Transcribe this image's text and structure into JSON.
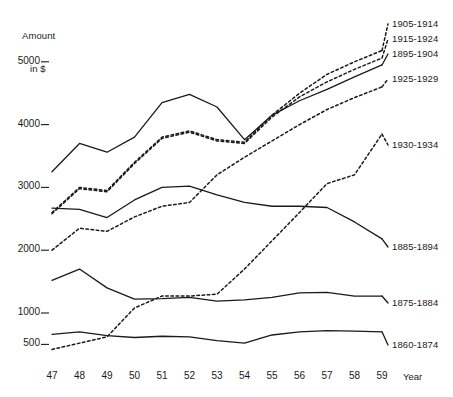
{
  "chart_data": {
    "type": "line",
    "title": "",
    "subtitle": "",
    "ylabel": "Amount\nin $",
    "ylabel_line1": "Amount",
    "ylabel_line2": "in $",
    "xlabel": "Year",
    "grid": false,
    "legend_position": "right-inline",
    "x": [
      47,
      48,
      49,
      50,
      51,
      52,
      53,
      54,
      55,
      56,
      57,
      58,
      59
    ],
    "xtick_labels": [
      "47",
      "48",
      "49",
      "50",
      "51",
      "52",
      "53",
      "54",
      "55",
      "56",
      "57",
      "58",
      "59"
    ],
    "ytick_values": [
      500,
      1000,
      2000,
      3000,
      4000,
      5000
    ],
    "ytick_labels": [
      "500",
      "1000",
      "2000",
      "3000",
      "4000",
      "5000"
    ],
    "xlim": [
      47,
      59
    ],
    "ylim": [
      300,
      5300
    ],
    "series": [
      {
        "name": "1905-1914",
        "style": "dashed",
        "label_x": 392,
        "label_y": 18,
        "values": [
          2600,
          3000,
          2950,
          3400,
          3800,
          3900,
          3760,
          3720,
          4150,
          4500,
          4800,
          5000,
          5180
        ]
      },
      {
        "name": "1915-1924",
        "style": "dashed",
        "label_x": 392,
        "label_y": 33,
        "values": [
          2580,
          2980,
          2930,
          3380,
          3780,
          3880,
          3740,
          3700,
          4120,
          4440,
          4680,
          4880,
          5060
        ]
      },
      {
        "name": "1895-1904",
        "style": "solid",
        "label_x": 392,
        "label_y": 48,
        "values": [
          3250,
          3700,
          3560,
          3800,
          4350,
          4480,
          4280,
          3760,
          4150,
          4380,
          4560,
          4760,
          4950
        ]
      },
      {
        "name": "1925-1929",
        "style": "dashed",
        "label_x": 392,
        "label_y": 73,
        "values": [
          2000,
          2350,
          2300,
          2530,
          2700,
          2760,
          3200,
          3480,
          3740,
          4000,
          4240,
          4430,
          4600
        ]
      },
      {
        "name": "1930-1934",
        "style": "dashed",
        "label_x": 392,
        "label_y": 139,
        "values": [
          420,
          520,
          620,
          1080,
          1270,
          1270,
          1300,
          1700,
          2150,
          2600,
          3060,
          3200,
          3850
        ]
      },
      {
        "name": "1885-1894",
        "style": "solid",
        "label_x": 392,
        "label_y": 241,
        "values": [
          2670,
          2650,
          2520,
          2800,
          3000,
          3020,
          2880,
          2760,
          2700,
          2700,
          2680,
          2450,
          2180
        ]
      },
      {
        "name": "1875-1884",
        "style": "solid",
        "label_x": 392,
        "label_y": 297,
        "values": [
          1520,
          1700,
          1400,
          1220,
          1230,
          1250,
          1190,
          1210,
          1250,
          1320,
          1330,
          1270,
          1270
        ]
      },
      {
        "name": "1860-1874",
        "style": "solid",
        "label_x": 392,
        "label_y": 339,
        "values": [
          660,
          700,
          640,
          610,
          630,
          620,
          560,
          520,
          650,
          700,
          720,
          710,
          700
        ]
      }
    ]
  },
  "axes": {
    "y_title_line1": "Amount",
    "y_title_line2": "in $",
    "x_title": "Year"
  }
}
